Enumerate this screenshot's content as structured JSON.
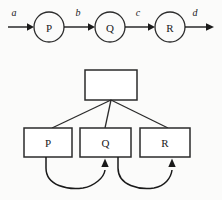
{
  "figure": {
    "background_color": "#fbfbfa",
    "line_color": "#2b2b2b",
    "text_color": "#1a1a1a"
  },
  "chain": {
    "name": "linear-flow-chain",
    "nodes": [
      {
        "id": "P",
        "label": "P",
        "cx": 49,
        "cy": 27,
        "r": 15
      },
      {
        "id": "Q",
        "label": "Q",
        "cx": 110,
        "cy": 27,
        "r": 15
      },
      {
        "id": "R",
        "label": "R",
        "cx": 170,
        "cy": 27,
        "r": 15
      }
    ],
    "edges": [
      {
        "id": "a",
        "label": "a",
        "from": "input",
        "to": "P",
        "label_x": 14,
        "label_y": 12
      },
      {
        "id": "b",
        "label": "b",
        "from": "P",
        "to": "Q",
        "label_x": 78,
        "label_y": 12
      },
      {
        "id": "c",
        "label": "c",
        "from": "Q",
        "to": "R",
        "label_x": 138,
        "label_y": 12
      },
      {
        "id": "d",
        "label": "d",
        "from": "R",
        "to": "output",
        "label_x": 195,
        "label_y": 12
      }
    ]
  },
  "tree": {
    "name": "hierarchy-tree",
    "root": {
      "id": "root",
      "label": "",
      "x": 85,
      "y": 70,
      "w": 52,
      "h": 30
    },
    "children": [
      {
        "id": "P",
        "label": "P",
        "x": 24,
        "y": 128,
        "w": 48,
        "h": 29
      },
      {
        "id": "Q",
        "label": "Q",
        "x": 80,
        "y": 128,
        "w": 51,
        "h": 29
      },
      {
        "id": "R",
        "label": "R",
        "x": 140,
        "y": 128,
        "w": 50,
        "h": 29
      }
    ],
    "feedback_arrows": [
      {
        "id": "p-to-q",
        "from": "P",
        "to": "Q"
      },
      {
        "id": "q-to-r",
        "from": "Q",
        "to": "R"
      }
    ]
  }
}
